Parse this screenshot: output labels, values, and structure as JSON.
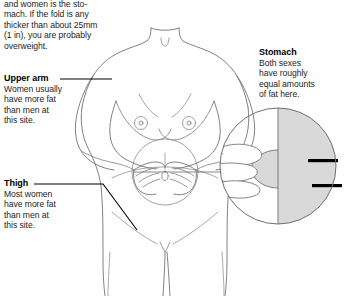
{
  "page": {
    "kind": "anatomical-illustration"
  },
  "intro": {
    "text": "and women is the sto-mach. If the fold is any thicker than about 25mm (1in), you are probably overweight.",
    "lines": [
      "and women is the sto-",
      "mach. If the fold is any",
      "thicker than about 25mm",
      "(1 in), you are probably",
      "overweight."
    ]
  },
  "labels": {
    "upper_arm": {
      "heading": "Upper arm",
      "body": "Women usually have more fat than men at this site.",
      "lines": [
        "Women usually",
        "have more fat",
        "than men at",
        "this site."
      ]
    },
    "thigh": {
      "heading": "Thigh",
      "body": "Most women have more fat than men at this site.",
      "lines": [
        "Most women",
        "have more fat",
        "than men at",
        "this site."
      ]
    },
    "stomach": {
      "heading": "Stomach",
      "body": "Both sexes have roughly equal amounts of fat here.",
      "lines": [
        "Both sexes",
        "have roughly",
        "equal amounts",
        "of fat here."
      ]
    }
  },
  "inset": {
    "name": "magnified-pinch-detail",
    "description": "Circular magnified view of fingers pinching a skin fold with two measurement bars",
    "measurement_bars": 2
  },
  "colors": {
    "outline": "#6f6f6f",
    "outline_dark": "#000000",
    "skin_shade": "#d9d9d9",
    "text": "#1d1d1d",
    "background": "#ffffff"
  }
}
